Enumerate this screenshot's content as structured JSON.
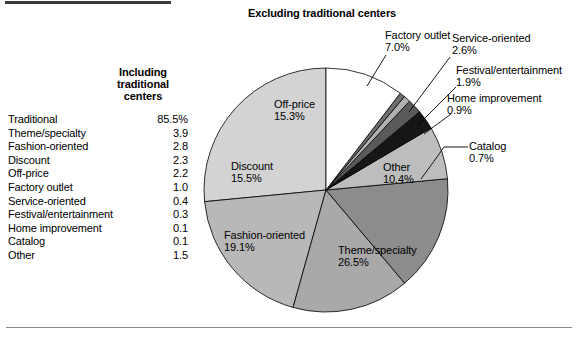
{
  "figure": {
    "chart_title": "Excluding traditional centers"
  },
  "table": {
    "header_lines": [
      "Including",
      "traditional",
      "centers"
    ],
    "rows": [
      {
        "label": "Traditional",
        "value": "85.5%"
      },
      {
        "label": "Theme/specialty",
        "value": "3.9"
      },
      {
        "label": "Fashion-oriented",
        "value": "2.8"
      },
      {
        "label": "Discount",
        "value": "2.3"
      },
      {
        "label": "Off-price",
        "value": "2.2"
      },
      {
        "label": "Factory outlet",
        "value": "1.0"
      },
      {
        "label": "Service-oriented",
        "value": "0.4"
      },
      {
        "label": "Festival/entertainment",
        "value": "0.3"
      },
      {
        "label": "Home improvement",
        "value": "0.1"
      },
      {
        "label": "Catalog",
        "value": "0.1"
      },
      {
        "label": "Other",
        "value": "1.5"
      }
    ]
  },
  "pie_labels": {
    "off_price": {
      "name": "Off-price",
      "pct": "15.3%"
    },
    "discount": {
      "name": "Discount",
      "pct": "15.5%"
    },
    "fashion": {
      "name": "Fashion-oriented",
      "pct": "19.1%"
    },
    "theme": {
      "name": "Theme/specialty",
      "pct": "26.5%"
    },
    "other": {
      "name": "Other",
      "pct": "10.4%"
    },
    "factory": {
      "name": "Factory outlet",
      "pct": "7.0%"
    },
    "service": {
      "name": "Service-oriented",
      "pct": "2.6%"
    },
    "festival": {
      "name": "Festival/entertainment",
      "pct": "1.9%"
    },
    "home": {
      "name": "Home improvement",
      "pct": "0.9%"
    },
    "catalog": {
      "name": "Catalog",
      "pct": "0.7%"
    }
  },
  "chart_data": {
    "type": "pie",
    "title": "Excluding traditional centers",
    "labels": [
      "Theme/specialty",
      "Fashion-oriented",
      "Discount",
      "Off-price",
      "Factory outlet",
      "Service-oriented",
      "Festival/entertainment",
      "Home improvement",
      "Catalog",
      "Other"
    ],
    "values": [
      26.5,
      19.1,
      15.5,
      15.3,
      7.0,
      2.6,
      1.9,
      0.9,
      0.7,
      10.4
    ],
    "units": "percent",
    "colors": [
      "#d3d3d3",
      "#b8b8b8",
      "#a9a9a9",
      "#8c8c8c",
      "#bdbdbd",
      "#161616",
      "#5a5a5a",
      "#b0b0b0",
      "#6e6e6e",
      "#ffffff"
    ],
    "legend": "none",
    "start_angle_deg": -90,
    "direction": "counterclockwise",
    "secondary_table": {
      "type": "table",
      "title": "Including traditional centers",
      "columns": [
        "Center type",
        "Including traditional centers"
      ],
      "rows": [
        [
          "Traditional",
          85.5
        ],
        [
          "Theme/specialty",
          3.9
        ],
        [
          "Fashion-oriented",
          2.8
        ],
        [
          "Discount",
          2.3
        ],
        [
          "Off-price",
          2.2
        ],
        [
          "Factory outlet",
          1.0
        ],
        [
          "Service-oriented",
          0.4
        ],
        [
          "Festival/entertainment",
          0.3
        ],
        [
          "Home improvement",
          0.1
        ],
        [
          "Catalog",
          0.1
        ],
        [
          "Other",
          1.5
        ]
      ],
      "units": "percent"
    }
  }
}
